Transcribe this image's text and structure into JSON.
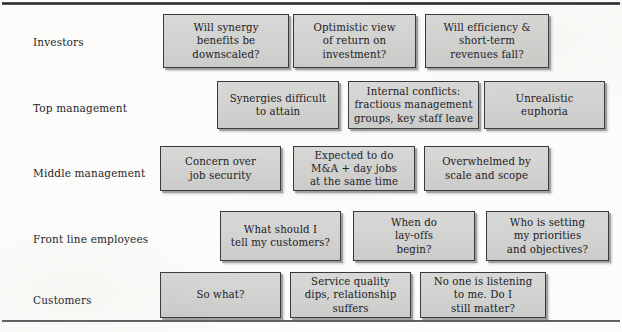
{
  "figure": {
    "colors": {
      "box_fill": "#d4d4d2",
      "box_border": "#3a3a3d",
      "text": "#202024",
      "rule": "#27272b",
      "background": "#fcfcfa"
    }
  },
  "rows": [
    {
      "label": "Investors",
      "boxes": [
        {
          "text": "Will synergy\nbenefits be\ndownscaled?"
        },
        {
          "text": "Optimistic view\nof return on\ninvestment?"
        },
        {
          "text": "Will efficiency &\nshort-term\nrevenues fall?"
        }
      ]
    },
    {
      "label": "Top management",
      "boxes": [
        {
          "text": "Synergies difficult\nto attain"
        },
        {
          "text": "Internal conflicts:\nfractious management\ngroups, key staff leave"
        },
        {
          "text": "Unrealistic\neuphoria"
        }
      ]
    },
    {
      "label": "Middle management",
      "boxes": [
        {
          "text": "Concern over\njob security"
        },
        {
          "text": "Expected to do\nM&A + day jobs\nat the same time"
        },
        {
          "text": "Overwhelmed by\nscale and scope"
        }
      ]
    },
    {
      "label": "Front line employees",
      "boxes": [
        {
          "text": "What should I\ntell my customers?"
        },
        {
          "text": "When do\nlay-offs\nbegin?"
        },
        {
          "text": "Who is setting\nmy priorities\nand objectives?"
        }
      ]
    },
    {
      "label": "Customers",
      "boxes": [
        {
          "text": "So what?"
        },
        {
          "text": "Service quality\ndips, relationship\nsuffers"
        },
        {
          "text": "No one is listening\nto me. Do I\nstill matter?"
        }
      ]
    }
  ],
  "layout": {
    "rows": [
      {
        "label_y": 37,
        "boxes": [
          {
            "x": 163,
            "y": 14,
            "w": 126,
            "h": 54
          },
          {
            "x": 293,
            "y": 14,
            "w": 123,
            "h": 54
          },
          {
            "x": 425,
            "y": 14,
            "w": 124,
            "h": 54
          }
        ]
      },
      {
        "label_y": 103,
        "boxes": [
          {
            "x": 217,
            "y": 81,
            "w": 122,
            "h": 48
          },
          {
            "x": 348,
            "y": 81,
            "w": 131,
            "h": 48
          },
          {
            "x": 484,
            "y": 81,
            "w": 121,
            "h": 48
          }
        ]
      },
      {
        "label_y": 168,
        "boxes": [
          {
            "x": 160,
            "y": 146,
            "w": 121,
            "h": 45
          },
          {
            "x": 293,
            "y": 146,
            "w": 122,
            "h": 45
          },
          {
            "x": 424,
            "y": 146,
            "w": 125,
            "h": 45
          }
        ]
      },
      {
        "label_y": 234,
        "boxes": [
          {
            "x": 220,
            "y": 211,
            "w": 121,
            "h": 50
          },
          {
            "x": 353,
            "y": 211,
            "w": 122,
            "h": 50
          },
          {
            "x": 486,
            "y": 211,
            "w": 123,
            "h": 50
          }
        ]
      },
      {
        "label_y": 295,
        "boxes": [
          {
            "x": 160,
            "y": 272,
            "w": 121,
            "h": 46
          },
          {
            "x": 290,
            "y": 272,
            "w": 121,
            "h": 46
          },
          {
            "x": 420,
            "y": 272,
            "w": 126,
            "h": 46
          }
        ]
      }
    ]
  }
}
